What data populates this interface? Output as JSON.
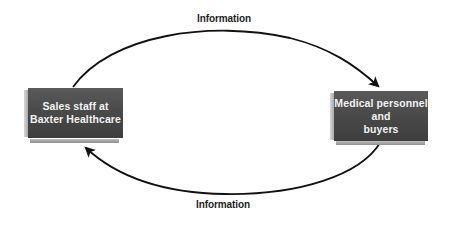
{
  "diagram": {
    "type": "information-flow-cycle",
    "nodes": [
      {
        "id": "sales-staff",
        "lines": [
          "Sales staff at",
          "Baxter Healthcare"
        ]
      },
      {
        "id": "medical-personnel",
        "lines": [
          "Medical personnel",
          "and",
          "buyers"
        ]
      }
    ],
    "edges": [
      {
        "from": "sales-staff",
        "to": "medical-personnel",
        "label": "Information",
        "position": "top"
      },
      {
        "from": "medical-personnel",
        "to": "sales-staff",
        "label": "Information",
        "position": "bottom"
      }
    ],
    "colors": {
      "box_fill": "#4a4a4a",
      "box_text": "#f2f2f2",
      "arrow": "#111111",
      "label_text": "#1e1e1e",
      "background": "#ffffff"
    }
  }
}
